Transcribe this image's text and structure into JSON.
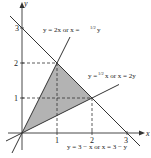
{
  "diagram": {
    "type": "region-plot",
    "axes": {
      "x_label": "x",
      "y_label": "y",
      "x_ticks": [
        "1",
        "2",
        "3"
      ],
      "y_ticks": [
        "1",
        "2",
        "3"
      ]
    },
    "lines": [
      {
        "id": "line-y-2x",
        "label_main": "y = 2x  or  x = ",
        "label_frac": "1/2",
        "label_tail": "y"
      },
      {
        "id": "line-y-half-x",
        "label_main": "y = ",
        "label_frac": "1/2",
        "label_tail": "x  or  x = 2y"
      },
      {
        "id": "line-y-3-minus-x",
        "label": "y = 3 − x  or  x = 3 − y"
      }
    ],
    "shaded_region": {
      "vertices": [
        [
          0,
          0
        ],
        [
          1,
          2
        ],
        [
          2,
          1
        ]
      ],
      "color": "#b3b3b3"
    },
    "colors": {
      "line": "#333333",
      "dashed": "#333333",
      "fill": "#b3b3b3"
    }
  }
}
